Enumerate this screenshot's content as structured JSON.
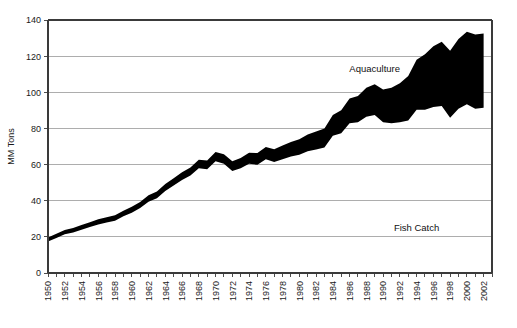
{
  "chart_data": {
    "type": "area",
    "title": "",
    "subtitle": "",
    "xlabel": "",
    "ylabel": "MM Tons",
    "ylim": [
      0,
      140
    ],
    "xlim": [
      1950,
      2003
    ],
    "grid": true,
    "legend_position": "inline-annotations",
    "y_ticks": [
      0,
      20,
      40,
      60,
      80,
      100,
      120,
      140
    ],
    "y_tick_labels": [
      "0",
      "20",
      "40",
      "60",
      "80",
      "100",
      "120",
      "140"
    ],
    "x_tick_labels": [
      "1950",
      "1952",
      "1954",
      "1956",
      "1958",
      "1960",
      "1962",
      "1964",
      "1966",
      "1968",
      "1970",
      "1972",
      "1974",
      "1976",
      "1978",
      "1980",
      "1982",
      "1984",
      "1986",
      "1988",
      "1990",
      "1992",
      "1994",
      "1996",
      "1998",
      "2000",
      "2002"
    ],
    "x": [
      1950,
      1951,
      1952,
      1953,
      1954,
      1955,
      1956,
      1957,
      1958,
      1959,
      1960,
      1961,
      1962,
      1963,
      1964,
      1965,
      1966,
      1967,
      1968,
      1969,
      1970,
      1971,
      1972,
      1973,
      1974,
      1975,
      1976,
      1977,
      1978,
      1979,
      1980,
      1981,
      1982,
      1983,
      1984,
      1985,
      1986,
      1987,
      1988,
      1989,
      1990,
      1991,
      1992,
      1993,
      1994,
      1995,
      1996,
      1997,
      1998,
      1999,
      2000,
      2001,
      2002
    ],
    "annotations": [
      {
        "text": "Aquaculture",
        "x": 1989,
        "y": 111
      },
      {
        "text": "Fish Catch",
        "x": 1994,
        "y": 23
      }
    ],
    "series": [
      {
        "name": "Fish Catch",
        "color": "#000000",
        "values": [
          19,
          21,
          23,
          24,
          25.5,
          27,
          28.5,
          29.5,
          30.5,
          33,
          35,
          37.5,
          41,
          43,
          47,
          50,
          53,
          55.5,
          59.5,
          59,
          63.5,
          62,
          58,
          59.5,
          62,
          61.5,
          64.5,
          63,
          64.5,
          66,
          67,
          69,
          70,
          71,
          77.5,
          79,
          84.5,
          85,
          88,
          89,
          85,
          84.5,
          85,
          86,
          92,
          92,
          93.5,
          94,
          87.5,
          92.5,
          95,
          92.5,
          93
        ]
      },
      {
        "name": "Aquaculture",
        "color": "#000000",
        "values": [
          0.6,
          0.7,
          0.8,
          0.9,
          1.0,
          1.1,
          1.2,
          1.3,
          1.4,
          1.5,
          1.7,
          1.8,
          2.0,
          2.1,
          2.3,
          2.5,
          2.7,
          2.9,
          3.1,
          3.3,
          3.5,
          3.7,
          3.9,
          4.2,
          4.5,
          4.9,
          5.2,
          5.5,
          6.0,
          6.5,
          7.0,
          7.6,
          8.3,
          9.0,
          10.0,
          11.0,
          12.0,
          13.0,
          14.5,
          15.5,
          16.5,
          18.0,
          20.0,
          23.0,
          26.0,
          29.0,
          32.0,
          34.0,
          35.5,
          37.0,
          38.5,
          39.5,
          39.5
        ]
      }
    ],
    "total_top_values": [
      19.6,
      21.7,
      23.8,
      24.9,
      26.5,
      28.1,
      29.7,
      30.8,
      31.9,
      34.5,
      36.7,
      39.3,
      43.0,
      45.1,
      49.3,
      52.5,
      55.7,
      58.4,
      62.6,
      62.3,
      67.0,
      65.7,
      61.9,
      63.7,
      66.5,
      66.4,
      69.7,
      68.5,
      70.5,
      72.5,
      74.0,
      76.6,
      78.3,
      80.0,
      87.5,
      90.0,
      96.5,
      98.0,
      102.5,
      104.5,
      101.5,
      102.5,
      105.0,
      109.0,
      118.0,
      121.0,
      125.5,
      128.0,
      123.0,
      129.5,
      133.5,
      132.0,
      132.5
    ]
  },
  "axis": {
    "y_axis_title": "MM Tons"
  }
}
